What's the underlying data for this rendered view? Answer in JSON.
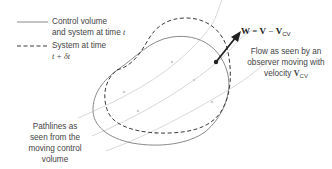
{
  "legend": {
    "solid": {
      "line1": "Control volume",
      "line2_prefix": "and system at time ",
      "line2_var": "t"
    },
    "dashed": {
      "line1": "System at time",
      "line2": "t + δt"
    }
  },
  "equation": {
    "lhs": "W",
    "eq": " = ",
    "v": "V",
    "minus": " − ",
    "vcv": "V",
    "vcv_sub": "CV"
  },
  "flow_label": {
    "line1": "Flow as seen by an",
    "line2": "observer moving with",
    "line3_prefix": "velocity ",
    "line3_var": "V",
    "line3_sub": "CV"
  },
  "pathlines_label": {
    "line1": "Pathlines as",
    "line2": "seen from the",
    "line3": "moving control",
    "line4": "volume"
  },
  "colors": {
    "control_volume_stroke": "#8a8a8a",
    "system_stroke": "#3a3a3a",
    "pathline_stroke": "#d2d2d2",
    "arrow": "#222222",
    "text": "#444444"
  }
}
